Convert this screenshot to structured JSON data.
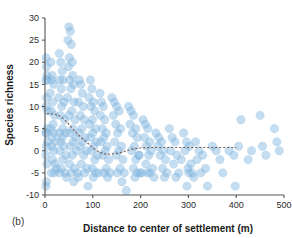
{
  "panel": {
    "label": "(b)"
  },
  "chart_data": {
    "type": "scatter",
    "title": "",
    "xlabel": "Distance to center of settlement (m)",
    "ylabel": "Species richness",
    "xlim": [
      0,
      500
    ],
    "ylim": [
      -10,
      30
    ],
    "xticks": [
      0,
      100,
      200,
      300,
      400,
      500
    ],
    "yticks": [
      -10,
      -5,
      0,
      5,
      10,
      15,
      20,
      25,
      30
    ],
    "xtick_labels": [
      "0",
      "100",
      "200",
      "300",
      "400",
      "500"
    ],
    "ytick_labels": [
      "-10",
      "-5",
      "0",
      "5",
      "10",
      "15",
      "20",
      "25",
      "30"
    ],
    "grid": false,
    "legend": null,
    "point_color": "#7fb3dd",
    "point_opacity": 0.45,
    "point_radius_px": 4.2,
    "trend_color": "#7a5a4a",
    "trend_style": "dashed",
    "series": [
      {
        "name": "plots",
        "points": [
          [
            2,
            21
          ],
          [
            3,
            19
          ],
          [
            4,
            17
          ],
          [
            2,
            16
          ],
          [
            5,
            16
          ],
          [
            3,
            12
          ],
          [
            2,
            10
          ],
          [
            6,
            9
          ],
          [
            4,
            5
          ],
          [
            3,
            4
          ],
          [
            2,
            4
          ],
          [
            5,
            2
          ],
          [
            3,
            1
          ],
          [
            2,
            -1
          ],
          [
            4,
            -3
          ],
          [
            3,
            -7
          ],
          [
            2,
            -8
          ],
          [
            12,
            20
          ],
          [
            15,
            17
          ],
          [
            14,
            16
          ],
          [
            18,
            15
          ],
          [
            11,
            13
          ],
          [
            16,
            11
          ],
          [
            13,
            9
          ],
          [
            20,
            8
          ],
          [
            17,
            6
          ],
          [
            12,
            5
          ],
          [
            19,
            4
          ],
          [
            15,
            3
          ],
          [
            22,
            2
          ],
          [
            14,
            1
          ],
          [
            18,
            0
          ],
          [
            16,
            -2
          ],
          [
            21,
            -3
          ],
          [
            13,
            -5
          ],
          [
            19,
            -5
          ],
          [
            24,
            -4
          ],
          [
            30,
            22
          ],
          [
            33,
            20
          ],
          [
            36,
            18
          ],
          [
            31,
            16
          ],
          [
            38,
            16
          ],
          [
            34,
            14
          ],
          [
            29,
            12
          ],
          [
            40,
            11
          ],
          [
            35,
            10
          ],
          [
            32,
            8
          ],
          [
            41,
            7
          ],
          [
            37,
            5
          ],
          [
            30,
            4
          ],
          [
            43,
            4
          ],
          [
            36,
            3
          ],
          [
            33,
            2
          ],
          [
            39,
            1
          ],
          [
            31,
            0
          ],
          [
            44,
            -1
          ],
          [
            37,
            -2
          ],
          [
            34,
            -4
          ],
          [
            42,
            -5
          ],
          [
            30,
            -5
          ],
          [
            45,
            -6
          ],
          [
            50,
            28
          ],
          [
            53,
            27
          ],
          [
            48,
            25
          ],
          [
            55,
            24
          ],
          [
            51,
            21
          ],
          [
            57,
            20
          ],
          [
            49,
            19
          ],
          [
            58,
            17
          ],
          [
            52,
            16
          ],
          [
            60,
            15
          ],
          [
            54,
            14
          ],
          [
            47,
            12
          ],
          [
            61,
            11
          ],
          [
            56,
            9
          ],
          [
            50,
            8
          ],
          [
            63,
            7
          ],
          [
            58,
            5
          ],
          [
            52,
            4
          ],
          [
            64,
            3
          ],
          [
            59,
            2
          ],
          [
            53,
            1
          ],
          [
            66,
            0
          ],
          [
            57,
            -1
          ],
          [
            51,
            -3
          ],
          [
            62,
            -4
          ],
          [
            55,
            -5
          ],
          [
            68,
            -5
          ],
          [
            60,
            -7
          ],
          [
            72,
            16
          ],
          [
            75,
            15
          ],
          [
            78,
            13
          ],
          [
            70,
            11
          ],
          [
            80,
            10
          ],
          [
            74,
            8
          ],
          [
            82,
            7
          ],
          [
            77,
            5
          ],
          [
            71,
            4
          ],
          [
            84,
            3
          ],
          [
            79,
            2
          ],
          [
            73,
            1
          ],
          [
            86,
            0
          ],
          [
            81,
            -1
          ],
          [
            76,
            -3
          ],
          [
            88,
            -4
          ],
          [
            83,
            -5
          ],
          [
            70,
            -6
          ],
          [
            90,
            -8
          ],
          [
            95,
            16
          ],
          [
            98,
            14
          ],
          [
            92,
            12
          ],
          [
            101,
            11
          ],
          [
            96,
            10
          ],
          [
            104,
            9
          ],
          [
            99,
            7
          ],
          [
            93,
            6
          ],
          [
            106,
            5
          ],
          [
            100,
            4
          ],
          [
            95,
            3
          ],
          [
            108,
            2
          ],
          [
            102,
            1
          ],
          [
            97,
            0
          ],
          [
            110,
            -1
          ],
          [
            104,
            -2
          ],
          [
            99,
            -4
          ],
          [
            112,
            -5
          ],
          [
            106,
            -5
          ],
          [
            101,
            -6
          ],
          [
            115,
            13
          ],
          [
            118,
            11
          ],
          [
            122,
            10
          ],
          [
            116,
            8
          ],
          [
            125,
            7
          ],
          [
            120,
            5
          ],
          [
            128,
            4
          ],
          [
            123,
            3
          ],
          [
            117,
            2
          ],
          [
            130,
            1
          ],
          [
            126,
            0
          ],
          [
            121,
            -1
          ],
          [
            133,
            -2
          ],
          [
            128,
            -4
          ],
          [
            124,
            -5
          ],
          [
            136,
            -5
          ],
          [
            131,
            -6
          ],
          [
            140,
            12
          ],
          [
            145,
            11
          ],
          [
            150,
            10
          ],
          [
            143,
            8
          ],
          [
            155,
            9
          ],
          [
            148,
            6
          ],
          [
            158,
            5
          ],
          [
            152,
            4
          ],
          [
            146,
            2
          ],
          [
            160,
            1
          ],
          [
            154,
            0
          ],
          [
            149,
            -1
          ],
          [
            163,
            -2
          ],
          [
            157,
            -4
          ],
          [
            151,
            -5
          ],
          [
            166,
            -5
          ],
          [
            161,
            -7
          ],
          [
            170,
            -9
          ],
          [
            175,
            10
          ],
          [
            180,
            9
          ],
          [
            185,
            8
          ],
          [
            178,
            6
          ],
          [
            190,
            5
          ],
          [
            183,
            4
          ],
          [
            193,
            3
          ],
          [
            187,
            1
          ],
          [
            181,
            0
          ],
          [
            196,
            -1
          ],
          [
            190,
            -2
          ],
          [
            185,
            -4
          ],
          [
            199,
            -5
          ],
          [
            193,
            -5
          ],
          [
            188,
            -6
          ],
          [
            202,
            -5
          ],
          [
            197,
            -1
          ],
          [
            205,
            7
          ],
          [
            210,
            6
          ],
          [
            215,
            5
          ],
          [
            208,
            3
          ],
          [
            219,
            2
          ],
          [
            212,
            1
          ],
          [
            222,
            0
          ],
          [
            217,
            -1
          ],
          [
            211,
            -3
          ],
          [
            225,
            -4
          ],
          [
            220,
            -5
          ],
          [
            214,
            -5
          ],
          [
            228,
            -6
          ],
          [
            232,
            4
          ],
          [
            238,
            3
          ],
          [
            244,
            2
          ],
          [
            236,
            1
          ],
          [
            248,
            0
          ],
          [
            241,
            -1
          ],
          [
            252,
            -2
          ],
          [
            246,
            -4
          ],
          [
            255,
            -5
          ],
          [
            250,
            -6
          ],
          [
            260,
            5
          ],
          [
            266,
            3
          ],
          [
            272,
            2
          ],
          [
            263,
            0
          ],
          [
            276,
            -1
          ],
          [
            269,
            -3
          ],
          [
            280,
            -5
          ],
          [
            274,
            -6
          ],
          [
            285,
            -2
          ],
          [
            290,
            4
          ],
          [
            296,
            2
          ],
          [
            302,
            1
          ],
          [
            293,
            0
          ],
          [
            305,
            -3
          ],
          [
            299,
            -4
          ],
          [
            308,
            -5
          ],
          [
            301,
            -5
          ],
          [
            311,
            -6
          ],
          [
            297,
            -8
          ],
          [
            315,
            2
          ],
          [
            322,
            0
          ],
          [
            330,
            -1
          ],
          [
            318,
            -2
          ],
          [
            336,
            -4
          ],
          [
            326,
            -5
          ],
          [
            340,
            -8
          ],
          [
            350,
            1
          ],
          [
            358,
            0
          ],
          [
            366,
            -2
          ],
          [
            372,
            -5
          ],
          [
            385,
            0
          ],
          [
            395,
            -1
          ],
          [
            398,
            -8
          ],
          [
            405,
            1
          ],
          [
            410,
            7
          ],
          [
            425,
            -2
          ],
          [
            432,
            0
          ],
          [
            450,
            8
          ],
          [
            455,
            1
          ],
          [
            462,
            -1
          ],
          [
            480,
            5
          ],
          [
            485,
            2
          ],
          [
            490,
            0
          ]
        ]
      }
    ],
    "trend_line": {
      "name": "smoothed-fit",
      "points": [
        [
          4,
          8.4
        ],
        [
          20,
          8.3
        ],
        [
          32,
          7.8
        ],
        [
          45,
          6.6
        ],
        [
          58,
          5.0
        ],
        [
          70,
          3.6
        ],
        [
          82,
          2.4
        ],
        [
          95,
          1.2
        ],
        [
          105,
          0.3
        ],
        [
          115,
          -0.4
        ],
        [
          125,
          -0.7
        ],
        [
          135,
          -0.8
        ],
        [
          150,
          -0.6
        ],
        [
          165,
          -0.2
        ],
        [
          180,
          0.3
        ],
        [
          195,
          0.6
        ],
        [
          210,
          0.7
        ],
        [
          225,
          0.75
        ],
        [
          250,
          0.75
        ],
        [
          280,
          0.75
        ],
        [
          320,
          0.75
        ],
        [
          360,
          0.75
        ],
        [
          400,
          0.75
        ]
      ]
    }
  }
}
